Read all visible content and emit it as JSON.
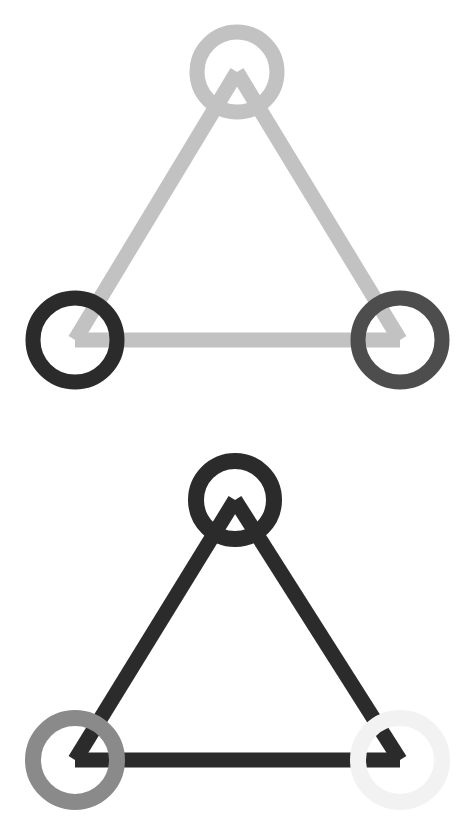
{
  "canvas": {
    "width": 469,
    "height": 839,
    "background": "#ffffff",
    "title": "Two triangular node-link graphs"
  },
  "figures": [
    {
      "id": "graph-top",
      "label": "Top triangular graph",
      "viewbox": "0 0 469 420",
      "stroke_width": 15,
      "node_stroke_width": 15,
      "edges": [
        {
          "id": "edge-top-left",
          "label": "apex to bottom-left",
          "x1": 237,
          "y1": 72,
          "x2": 75,
          "y2": 340,
          "color": "#c2c2c2"
        },
        {
          "id": "edge-top-right",
          "label": "apex to bottom-right",
          "x1": 237,
          "y1": 72,
          "x2": 400,
          "y2": 340,
          "color": "#c2c2c2"
        },
        {
          "id": "edge-top-bottom",
          "label": "bottom-left to bottom-right",
          "x1": 75,
          "y1": 340,
          "x2": 400,
          "y2": 340,
          "color": "#c2c2c2"
        }
      ],
      "nodes": [
        {
          "id": "node-top-apex",
          "label": "apex node",
          "cx": 237,
          "cy": 72,
          "r": 40,
          "color": "#c2c2c2"
        },
        {
          "id": "node-top-bottomleft",
          "label": "bottom-left node",
          "cx": 75,
          "cy": 340,
          "r": 42,
          "color": "#2b2b2b"
        },
        {
          "id": "node-top-bottomright",
          "label": "bottom-right node",
          "cx": 400,
          "cy": 340,
          "r": 42,
          "color": "#4d4d4d"
        }
      ]
    },
    {
      "id": "graph-bottom",
      "label": "Bottom triangular graph",
      "viewbox": "0 0 469 419",
      "stroke_width": 15,
      "node_stroke_width": 16,
      "edges": [
        {
          "id": "edge-bottom-left",
          "label": "apex to bottom-left",
          "x1": 235,
          "y1": 80,
          "x2": 75,
          "y2": 340,
          "color": "#2b2b2b"
        },
        {
          "id": "edge-bottom-right",
          "label": "apex to bottom-right",
          "x1": 235,
          "y1": 80,
          "x2": 400,
          "y2": 340,
          "color": "#2b2b2b"
        },
        {
          "id": "edge-bottom-bottom",
          "label": "bottom-left to bottom-right",
          "x1": 75,
          "y1": 340,
          "x2": 400,
          "y2": 340,
          "color": "#2b2b2b"
        }
      ],
      "nodes": [
        {
          "id": "node-bottom-apex",
          "label": "apex node",
          "cx": 235,
          "cy": 80,
          "r": 39,
          "color": "#2b2b2b"
        },
        {
          "id": "node-bottom-bottomleft",
          "label": "bottom-left node",
          "cx": 75,
          "cy": 340,
          "r": 42,
          "color": "#8a8a8a"
        },
        {
          "id": "node-bottom-bottomright",
          "label": "bottom-right node",
          "cx": 400,
          "cy": 340,
          "r": 42,
          "color": "#f2f2f2"
        }
      ]
    }
  ],
  "palette": {
    "white": "#ffffff",
    "near_white": "#f2f2f2",
    "light_gray": "#c2c2c2",
    "medium_gray": "#8a8a8a",
    "dark_gray": "#4d4d4d",
    "near_black": "#2b2b2b"
  },
  "chart_data": {
    "type": "diagram",
    "graphs": [
      {
        "name": "Top graph",
        "edge_color": "#c2c2c2",
        "nodes": [
          {
            "position": "apex",
            "color": "#c2c2c2",
            "gray_level": 194
          },
          {
            "position": "bottom-left",
            "color": "#2b2b2b",
            "gray_level": 43
          },
          {
            "position": "bottom-right",
            "color": "#4d4d4d",
            "gray_level": 77
          }
        ],
        "edges": [
          {
            "from": "apex",
            "to": "bottom-left",
            "color": "#c2c2c2"
          },
          {
            "from": "apex",
            "to": "bottom-right",
            "color": "#c2c2c2"
          },
          {
            "from": "bottom-left",
            "to": "bottom-right",
            "color": "#c2c2c2"
          }
        ]
      },
      {
        "name": "Bottom graph",
        "edge_color": "#2b2b2b",
        "nodes": [
          {
            "position": "apex",
            "color": "#2b2b2b",
            "gray_level": 43
          },
          {
            "position": "bottom-left",
            "color": "#8a8a8a",
            "gray_level": 138
          },
          {
            "position": "bottom-right",
            "color": "#f2f2f2",
            "gray_level": 242
          }
        ],
        "edges": [
          {
            "from": "apex",
            "to": "bottom-left",
            "color": "#2b2b2b"
          },
          {
            "from": "apex",
            "to": "bottom-right",
            "color": "#2b2b2b"
          },
          {
            "from": "bottom-left",
            "to": "bottom-right",
            "color": "#2b2b2b"
          }
        ]
      }
    ]
  }
}
